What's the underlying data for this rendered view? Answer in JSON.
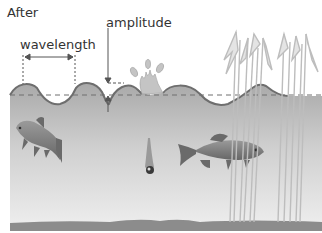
{
  "diagram": {
    "title": "After",
    "labels": {
      "wavelength": "wavelength",
      "amplitude": "amplitude"
    },
    "elements": [
      "wave surface",
      "still water level (dashed)",
      "splash",
      "falling pebble",
      "fish (left)",
      "fish (right)",
      "reeds",
      "lake bed"
    ],
    "colors": {
      "water_top": "#a9a9a9",
      "water_bottom": "#ebebeb",
      "wave_line": "#6e6e6e",
      "lake_bed": "#8c8c8c",
      "fish": "#7d7d7d",
      "reeds": "#e0e0e0"
    }
  }
}
